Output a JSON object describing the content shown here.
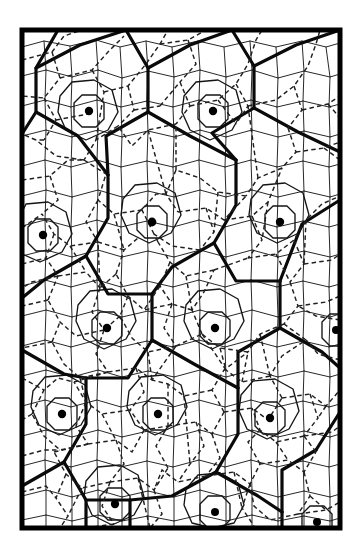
{
  "figure": {
    "kind": "hierarchical-tessellation",
    "background_color": "#ffffff",
    "ink_color": "#000000",
    "frame": {
      "x": 22,
      "y": 30,
      "width": 318,
      "height": 498,
      "stroke_width": 5.0,
      "color": "#000000"
    },
    "levels": [
      {
        "id": "coarse",
        "label": "coarse cell boundary",
        "style": "solid",
        "stroke_width": 3.2,
        "color": "#0a0a0a"
      },
      {
        "id": "medium",
        "label": "medium cell boundary",
        "style": "solid",
        "stroke_width": 1.35,
        "color": "#141414"
      },
      {
        "id": "fine",
        "label": "fine cell boundary",
        "style": "solid",
        "stroke_width": 0.95,
        "color": "#1b1b1b"
      },
      {
        "id": "dashed",
        "label": "dual / sub-lattice link",
        "style": "dashed",
        "stroke_width": 1.45,
        "color": "#202020",
        "dash": "4.5 3.2"
      }
    ],
    "lattice": {
      "type": "hexagonal",
      "coarse_spacing_x": 107,
      "coarse_spacing_y": 93,
      "fine_spacing": 30,
      "row_stagger": true
    },
    "nucleus_dots": {
      "label": "cell nucleus",
      "radius": 4.0,
      "color": "#000000",
      "count": 16,
      "points": [
        {
          "x": 89,
          "y": 111,
          "r": 4.2
        },
        {
          "x": 213,
          "y": 111,
          "r": 4.2
        },
        {
          "x": 43,
          "y": 235,
          "r": 4.2
        },
        {
          "x": 152,
          "y": 222,
          "r": 4.4
        },
        {
          "x": 280,
          "y": 222,
          "r": 4.2
        },
        {
          "x": 107,
          "y": 328,
          "r": 4.2
        },
        {
          "x": 215,
          "y": 328,
          "r": 4.2
        },
        {
          "x": 336,
          "y": 330,
          "r": 4.0
        },
        {
          "x": 62,
          "y": 414,
          "r": 4.2
        },
        {
          "x": 158,
          "y": 414,
          "r": 4.2
        },
        {
          "x": 270,
          "y": 418,
          "r": 4.2
        },
        {
          "x": 115,
          "y": 504,
          "r": 4.2
        },
        {
          "x": 215,
          "y": 512,
          "r": 4.0
        },
        {
          "x": 317,
          "y": 522,
          "r": 4.0
        }
      ]
    },
    "coarse_network": {
      "label": "thick hexagonal superstructure",
      "description": "Large hexagonal cells joined at 120-degree Y junctions, one nucleus dot per cell."
    }
  }
}
